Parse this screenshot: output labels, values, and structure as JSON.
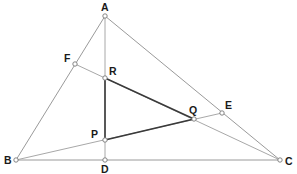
{
  "diagram": {
    "points": {
      "A": {
        "label": "A",
        "x": 105,
        "y": 16
      },
      "B": {
        "label": "B",
        "x": 16,
        "y": 160
      },
      "C": {
        "label": "C",
        "x": 280,
        "y": 160
      },
      "D": {
        "label": "D",
        "x": 105,
        "y": 160
      },
      "E": {
        "label": "E",
        "x": 222,
        "y": 113
      },
      "F": {
        "label": "F",
        "x": 75,
        "y": 64
      },
      "P": {
        "label": "P",
        "x": 105,
        "y": 140
      },
      "Q": {
        "label": "Q",
        "x": 194,
        "y": 119
      },
      "R": {
        "label": "R",
        "x": 105,
        "y": 78
      }
    },
    "outer_triangle": [
      "A",
      "B",
      "C"
    ],
    "cevians": [
      [
        "A",
        "D"
      ],
      [
        "B",
        "E"
      ],
      [
        "C",
        "F"
      ]
    ],
    "inner_triangle": [
      "P",
      "Q",
      "R"
    ],
    "colors": {
      "outer": "#9a9a9a",
      "cevian": "#a8a8a8",
      "inner": "#3a3a3a",
      "label": "#1a1a1a"
    }
  }
}
